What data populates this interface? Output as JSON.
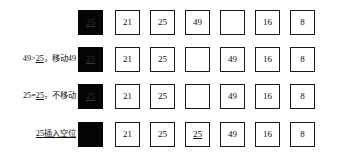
{
  "diagram": {
    "title": "",
    "type": "insertion-sort-steps",
    "key_value": "25",
    "rows": [
      {
        "label_parts": [],
        "label_text": "",
        "key_cell": {
          "value": "25",
          "style": "black",
          "underlined": true,
          "empty": false
        },
        "cells": [
          {
            "value": "21",
            "empty": false,
            "underlined": false
          },
          {
            "value": "25",
            "empty": false,
            "underlined": false
          },
          {
            "value": "49",
            "empty": false,
            "underlined": false
          },
          {
            "value": "",
            "empty": true,
            "underlined": false
          },
          {
            "value": "16",
            "empty": false,
            "underlined": false
          },
          {
            "value": "8",
            "empty": false,
            "underlined": false
          }
        ]
      },
      {
        "label_parts": [
          {
            "text": "49>",
            "underlined": false
          },
          {
            "text": "25",
            "underlined": true
          },
          {
            "text": "，移动49",
            "underlined": false
          }
        ],
        "label_text": "49>25，移动49",
        "key_cell": {
          "value": "25",
          "style": "black",
          "underlined": true,
          "empty": false
        },
        "cells": [
          {
            "value": "21",
            "empty": false,
            "underlined": false
          },
          {
            "value": "25",
            "empty": false,
            "underlined": false
          },
          {
            "value": "",
            "empty": true,
            "underlined": false
          },
          {
            "value": "49",
            "empty": false,
            "underlined": false
          },
          {
            "value": "16",
            "empty": false,
            "underlined": false
          },
          {
            "value": "8",
            "empty": false,
            "underlined": false
          }
        ]
      },
      {
        "label_parts": [
          {
            "text": "25=",
            "underlined": false
          },
          {
            "text": "25",
            "underlined": true
          },
          {
            "text": "，不移动",
            "underlined": false
          }
        ],
        "label_text": "25=25，不移动",
        "key_cell": {
          "value": "25",
          "style": "black",
          "underlined": true,
          "empty": false
        },
        "cells": [
          {
            "value": "21",
            "empty": false,
            "underlined": false
          },
          {
            "value": "25",
            "empty": false,
            "underlined": false
          },
          {
            "value": "",
            "empty": true,
            "underlined": false
          },
          {
            "value": "49",
            "empty": false,
            "underlined": false
          },
          {
            "value": "16",
            "empty": false,
            "underlined": false
          },
          {
            "value": "8",
            "empty": false,
            "underlined": false
          }
        ]
      },
      {
        "label_parts": [
          {
            "text": "25",
            "underlined": true
          },
          {
            "text": "插入空位",
            "underlined": true
          }
        ],
        "label_text": "25插入空位",
        "key_cell": {
          "value": "",
          "style": "black",
          "underlined": false,
          "empty": true
        },
        "cells": [
          {
            "value": "21",
            "empty": false,
            "underlined": false
          },
          {
            "value": "25",
            "empty": false,
            "underlined": false
          },
          {
            "value": "25",
            "empty": false,
            "underlined": true
          },
          {
            "value": "49",
            "empty": false,
            "underlined": false
          },
          {
            "value": "16",
            "empty": false,
            "underlined": false
          },
          {
            "value": "8",
            "empty": false,
            "underlined": false
          }
        ]
      }
    ],
    "colors": {
      "border": "#1a1a1a",
      "key_fill": "#050505",
      "text": "#0d0d0d",
      "background": "#ffffff"
    }
  }
}
